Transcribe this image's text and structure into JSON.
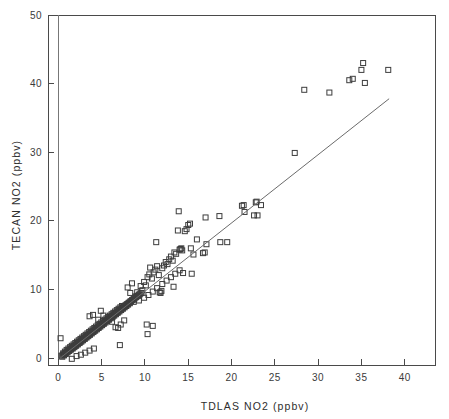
{
  "chart_data": {
    "type": "scatter",
    "title": "",
    "xlabel": "TDLAS NO2 (ppbv)",
    "ylabel": "TECAN NO2 (ppbv)",
    "xlim": [
      -1.2,
      43.5
    ],
    "ylim": [
      -1.0,
      50.0
    ],
    "xticks": [
      0,
      5,
      10,
      15,
      20,
      25,
      30,
      35,
      40
    ],
    "xticklabels": [
      "0",
      "5",
      "10",
      "15",
      "20",
      "25",
      "30",
      "35",
      "40"
    ],
    "yticks": [
      0,
      10,
      20,
      30,
      40,
      50
    ],
    "yticklabels": [
      "0",
      "10",
      "20",
      "30",
      "40",
      "50"
    ],
    "grid": false,
    "legend": null,
    "marker": "open-square",
    "marker_size": 5,
    "marker_color": "#3d3d3d",
    "frame_color": "#4a4a4a",
    "fit_line": {
      "type": "line",
      "label": "1:1 / regression line",
      "color": "#6b6b6b",
      "x": [
        0.2,
        38.2
      ],
      "y": [
        0.0,
        37.8
      ]
    },
    "series": [
      {
        "name": "TECAN vs TDLAS NO2",
        "points": [
          [
            0.25,
            2.9
          ],
          [
            1.55,
            -0.1
          ],
          [
            0.35,
            0.35
          ],
          [
            0.5,
            0.45
          ],
          [
            0.6,
            0.55
          ],
          [
            0.7,
            0.6
          ],
          [
            0.8,
            0.75
          ],
          [
            0.9,
            0.8
          ],
          [
            1.0,
            0.95
          ],
          [
            1.1,
            1.0
          ],
          [
            1.2,
            1.15
          ],
          [
            1.3,
            1.2
          ],
          [
            1.4,
            1.3
          ],
          [
            1.5,
            1.45
          ],
          [
            1.6,
            1.5
          ],
          [
            1.7,
            1.6
          ],
          [
            1.8,
            1.75
          ],
          [
            1.9,
            1.8
          ],
          [
            2.0,
            1.95
          ],
          [
            2.1,
            2.0
          ],
          [
            2.2,
            2.1
          ],
          [
            2.3,
            2.25
          ],
          [
            2.4,
            2.3
          ],
          [
            2.5,
            2.4
          ],
          [
            2.6,
            2.55
          ],
          [
            2.7,
            2.6
          ],
          [
            2.8,
            2.7
          ],
          [
            2.9,
            2.85
          ],
          [
            3.0,
            2.9
          ],
          [
            3.1,
            3.05
          ],
          [
            3.2,
            3.1
          ],
          [
            3.3,
            3.2
          ],
          [
            3.4,
            3.35
          ],
          [
            3.5,
            3.4
          ],
          [
            3.6,
            3.5
          ],
          [
            3.7,
            3.65
          ],
          [
            3.8,
            3.7
          ],
          [
            3.9,
            3.85
          ],
          [
            4.0,
            3.9
          ],
          [
            4.1,
            4.0
          ],
          [
            4.2,
            4.15
          ],
          [
            4.3,
            4.2
          ],
          [
            4.4,
            4.35
          ],
          [
            4.5,
            4.4
          ],
          [
            4.6,
            4.5
          ],
          [
            4.7,
            4.65
          ],
          [
            4.8,
            4.7
          ],
          [
            4.9,
            4.85
          ],
          [
            5.0,
            4.9
          ],
          [
            5.1,
            5.0
          ],
          [
            5.2,
            5.15
          ],
          [
            5.3,
            5.2
          ],
          [
            5.4,
            5.35
          ],
          [
            5.5,
            5.4
          ],
          [
            5.6,
            5.5
          ],
          [
            5.7,
            5.65
          ],
          [
            5.8,
            5.7
          ],
          [
            5.9,
            5.85
          ],
          [
            6.0,
            5.9
          ],
          [
            6.1,
            6.05
          ],
          [
            6.2,
            6.1
          ],
          [
            6.3,
            6.2
          ],
          [
            6.4,
            6.35
          ],
          [
            6.5,
            6.4
          ],
          [
            6.6,
            6.55
          ],
          [
            6.7,
            6.6
          ],
          [
            6.8,
            6.75
          ],
          [
            6.9,
            6.8
          ],
          [
            7.0,
            6.95
          ],
          [
            7.1,
            7.0
          ],
          [
            7.2,
            7.1
          ],
          [
            7.3,
            7.25
          ],
          [
            7.4,
            7.3
          ],
          [
            7.5,
            7.45
          ],
          [
            7.6,
            7.5
          ],
          [
            7.7,
            7.65
          ],
          [
            7.8,
            7.7
          ],
          [
            7.9,
            7.85
          ],
          [
            8.0,
            7.9
          ],
          [
            8.1,
            8.05
          ],
          [
            8.2,
            8.1
          ],
          [
            8.3,
            8.25
          ],
          [
            8.4,
            8.3
          ],
          [
            8.5,
            8.45
          ],
          [
            8.6,
            8.5
          ],
          [
            8.7,
            8.65
          ],
          [
            8.8,
            8.7
          ],
          [
            8.9,
            8.85
          ],
          [
            9.0,
            8.9
          ],
          [
            9.1,
            9.05
          ],
          [
            9.2,
            9.1
          ],
          [
            9.3,
            9.25
          ],
          [
            9.4,
            9.3
          ],
          [
            9.5,
            9.45
          ],
          [
            9.6,
            9.5
          ],
          [
            0.45,
            0.2
          ],
          [
            0.65,
            0.4
          ],
          [
            0.85,
            0.6
          ],
          [
            1.05,
            0.85
          ],
          [
            1.25,
            1.05
          ],
          [
            1.45,
            1.25
          ],
          [
            1.65,
            1.4
          ],
          [
            1.85,
            1.6
          ],
          [
            2.05,
            1.8
          ],
          [
            2.25,
            2.0
          ],
          [
            2.45,
            2.2
          ],
          [
            2.65,
            2.4
          ],
          [
            2.85,
            2.6
          ],
          [
            3.05,
            2.8
          ],
          [
            3.25,
            3.0
          ],
          [
            3.45,
            3.2
          ],
          [
            3.65,
            3.4
          ],
          [
            3.85,
            3.6
          ],
          [
            4.05,
            3.8
          ],
          [
            4.25,
            4.0
          ],
          [
            4.45,
            4.2
          ],
          [
            4.65,
            4.4
          ],
          [
            4.85,
            4.6
          ],
          [
            5.05,
            4.8
          ],
          [
            5.25,
            5.0
          ],
          [
            5.45,
            5.2
          ],
          [
            5.65,
            5.4
          ],
          [
            5.85,
            5.6
          ],
          [
            6.05,
            5.8
          ],
          [
            6.25,
            6.0
          ],
          [
            6.45,
            6.2
          ],
          [
            6.65,
            6.4
          ],
          [
            6.85,
            6.6
          ],
          [
            7.05,
            6.8
          ],
          [
            7.25,
            7.0
          ],
          [
            7.45,
            7.2
          ],
          [
            7.65,
            7.4
          ],
          [
            7.85,
            7.6
          ],
          [
            8.05,
            7.8
          ],
          [
            8.25,
            8.0
          ],
          [
            0.55,
            0.7
          ],
          [
            0.75,
            0.95
          ],
          [
            0.95,
            1.2
          ],
          [
            1.15,
            1.4
          ],
          [
            1.35,
            1.6
          ],
          [
            1.55,
            1.8
          ],
          [
            1.75,
            2.0
          ],
          [
            1.95,
            2.2
          ],
          [
            2.15,
            2.4
          ],
          [
            2.35,
            2.6
          ],
          [
            2.55,
            2.8
          ],
          [
            2.75,
            3.0
          ],
          [
            2.95,
            3.2
          ],
          [
            3.15,
            3.4
          ],
          [
            3.35,
            3.6
          ],
          [
            3.55,
            3.8
          ],
          [
            3.75,
            4.0
          ],
          [
            3.95,
            4.2
          ],
          [
            4.15,
            4.4
          ],
          [
            4.35,
            4.6
          ],
          [
            4.55,
            4.8
          ],
          [
            4.75,
            5.0
          ],
          [
            4.95,
            5.2
          ],
          [
            5.15,
            5.4
          ],
          [
            5.35,
            5.6
          ],
          [
            5.55,
            5.8
          ],
          [
            5.75,
            6.0
          ],
          [
            5.95,
            6.2
          ],
          [
            6.15,
            6.4
          ],
          [
            6.35,
            6.6
          ],
          [
            6.55,
            6.8
          ],
          [
            6.75,
            7.0
          ],
          [
            6.95,
            7.2
          ],
          [
            7.15,
            7.4
          ],
          [
            7.35,
            7.6
          ],
          [
            3.6,
            6.1
          ],
          [
            4.0,
            6.3
          ],
          [
            4.6,
            5.6
          ],
          [
            4.9,
            6.9
          ],
          [
            5.2,
            6.2
          ],
          [
            6.2,
            5.3
          ],
          [
            6.6,
            4.5
          ],
          [
            6.9,
            4.4
          ],
          [
            7.6,
            5.5
          ],
          [
            7.2,
            4.9
          ],
          [
            7.1,
            1.9
          ],
          [
            10.2,
            4.9
          ],
          [
            10.3,
            3.5
          ],
          [
            10.9,
            4.7
          ],
          [
            8.0,
            10.3
          ],
          [
            8.3,
            9.5
          ],
          [
            8.5,
            10.9
          ],
          [
            8.7,
            8.2
          ],
          [
            8.9,
            9.0
          ],
          [
            9.1,
            9.6
          ],
          [
            9.3,
            8.4
          ],
          [
            9.5,
            10.5
          ],
          [
            9.7,
            9.9
          ],
          [
            9.9,
            11.1
          ],
          [
            10.1,
            10.6
          ],
          [
            10.3,
            11.8
          ],
          [
            10.5,
            12.2
          ],
          [
            10.6,
            13.2
          ],
          [
            10.8,
            11.6
          ],
          [
            11.0,
            12.5
          ],
          [
            11.2,
            12.9
          ],
          [
            11.3,
            16.9
          ],
          [
            11.4,
            13.4
          ],
          [
            11.6,
            12.1
          ],
          [
            11.7,
            9.6
          ],
          [
            11.8,
            9.5
          ],
          [
            11.9,
            9.8
          ],
          [
            12.0,
            13.1
          ],
          [
            12.2,
            13.5
          ],
          [
            12.4,
            14.0
          ],
          [
            12.6,
            13.7
          ],
          [
            12.8,
            14.4
          ],
          [
            13.0,
            14.8
          ],
          [
            13.2,
            14.2
          ],
          [
            13.3,
            10.4
          ],
          [
            13.4,
            15.4
          ],
          [
            13.6,
            15.2
          ],
          [
            13.8,
            18.6
          ],
          [
            13.9,
            21.4
          ],
          [
            14.0,
            15.8
          ],
          [
            14.1,
            15.9
          ],
          [
            14.2,
            16.0
          ],
          [
            14.3,
            15.7
          ],
          [
            14.4,
            12.4
          ],
          [
            14.6,
            18.5
          ],
          [
            14.8,
            18.8
          ],
          [
            15.0,
            19.4
          ],
          [
            15.2,
            19.6
          ],
          [
            15.3,
            16.0
          ],
          [
            15.4,
            12.3
          ],
          [
            15.6,
            15.1
          ],
          [
            16.0,
            17.3
          ],
          [
            16.7,
            15.3
          ],
          [
            16.9,
            15.4
          ],
          [
            17.0,
            20.5
          ],
          [
            17.1,
            16.6
          ],
          [
            18.6,
            20.7
          ],
          [
            18.7,
            16.9
          ],
          [
            19.5,
            16.9
          ],
          [
            21.2,
            22.2
          ],
          [
            21.4,
            22.3
          ],
          [
            21.5,
            21.3
          ],
          [
            22.6,
            20.8
          ],
          [
            22.8,
            22.7
          ],
          [
            22.9,
            22.8
          ],
          [
            23.0,
            20.8
          ],
          [
            23.4,
            22.3
          ],
          [
            27.3,
            29.9
          ],
          [
            28.4,
            39.1
          ],
          [
            31.3,
            38.7
          ],
          [
            33.6,
            40.5
          ],
          [
            34.0,
            40.7
          ],
          [
            35.0,
            42.0
          ],
          [
            35.2,
            43.0
          ],
          [
            35.4,
            40.1
          ],
          [
            38.1,
            42.0
          ],
          [
            2.1,
            0.3
          ],
          [
            2.6,
            0.5
          ],
          [
            3.1,
            0.8
          ],
          [
            3.6,
            1.1
          ],
          [
            4.1,
            1.4
          ],
          [
            9.9,
            8.8
          ],
          [
            10.4,
            9.2
          ],
          [
            10.9,
            9.7
          ],
          [
            11.4,
            10.2
          ],
          [
            12.0,
            10.8
          ],
          [
            12.5,
            11.3
          ],
          [
            13.0,
            11.8
          ],
          [
            13.5,
            12.3
          ],
          [
            14.0,
            12.8
          ]
        ]
      }
    ]
  }
}
